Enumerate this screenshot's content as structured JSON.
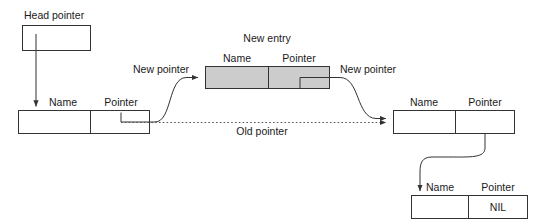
{
  "diagram": {
    "colors": {
      "stroke": "#333333",
      "new_entry_fill": "#cccccc",
      "text": "#1a1a1a",
      "dotted": "#555555"
    },
    "labels": {
      "head_pointer": "Head pointer",
      "new_entry": "New entry",
      "new_pointer_left": "New pointer",
      "new_pointer_right": "New pointer",
      "old_pointer": "Old pointer"
    },
    "field_headers": {
      "name": "Name",
      "pointer": "Pointer"
    },
    "nodes": [
      {
        "id": "head-pointer-box",
        "name_header": "",
        "pointer_header": "",
        "name_value": "",
        "pointer_value": ""
      },
      {
        "id": "existing-node",
        "name_header": "Name",
        "pointer_header": "Pointer",
        "name_value": "",
        "pointer_value": ""
      },
      {
        "id": "new-entry-node",
        "name_header": "Name",
        "pointer_header": "Pointer",
        "name_value": "",
        "pointer_value": ""
      },
      {
        "id": "next-node",
        "name_header": "Name",
        "pointer_header": "Pointer",
        "name_value": "",
        "pointer_value": ""
      },
      {
        "id": "tail-node",
        "name_header": "Name",
        "pointer_header": "Pointer",
        "name_value": "",
        "pointer_value": "NIL"
      }
    ]
  }
}
